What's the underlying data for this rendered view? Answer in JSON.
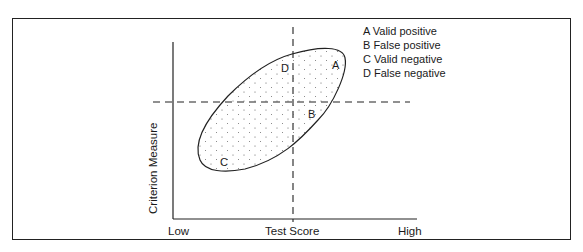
{
  "diagram": {
    "axes": {
      "x_label": "Test Score",
      "y_label": "Criterion Measure",
      "x_low": "Low",
      "x_high": "High"
    },
    "regions": {
      "A": "A",
      "B": "B",
      "C": "C",
      "D": "D"
    },
    "legend": [
      "A Valid positive",
      "B False positive",
      "C Valid negative",
      "D False negative"
    ],
    "colors": {
      "line": "#222222",
      "background": "#ffffff"
    }
  }
}
